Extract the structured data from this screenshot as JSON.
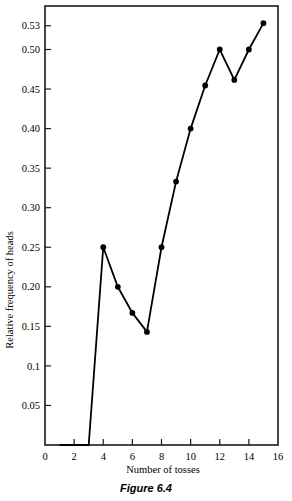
{
  "figure": {
    "caption": "Figure 6.4"
  },
  "chart_data": {
    "type": "line",
    "title": "",
    "subtitle": "",
    "xlabel": "Number of tosses",
    "ylabel": "Relative frequency of heads",
    "xlim": [
      0,
      16
    ],
    "ylim": [
      0,
      0.555
    ],
    "grid": false,
    "legend": null,
    "marker": "filled-circle",
    "line_color": "#000000",
    "marker_color": "#000000",
    "background_color": "#ffffff",
    "frame": true,
    "x_ticks": [
      0,
      2,
      4,
      6,
      8,
      10,
      12,
      14,
      16
    ],
    "x_tick_labels": [
      "0",
      "2",
      "4",
      "6",
      "8",
      "10",
      "12",
      "14",
      "16"
    ],
    "y_ticks": [
      0.05,
      0.1,
      0.15,
      0.2,
      0.25,
      0.3,
      0.35,
      0.4,
      0.45,
      0.5,
      0.53
    ],
    "y_tick_labels": [
      "0.05",
      "0.1",
      "0.15",
      "0.20",
      "0.25",
      "0.30",
      "0.35",
      "0.40",
      "0.45",
      "0.50",
      "0.53"
    ],
    "x": [
      1,
      2,
      3,
      4,
      5,
      6,
      7,
      8,
      9,
      10,
      11,
      12,
      13,
      14,
      15
    ],
    "values": [
      0,
      0,
      0,
      0.25,
      0.2,
      0.167,
      0.143,
      0.25,
      0.333,
      0.4,
      0.4545,
      0.5,
      0.4615,
      0.5,
      0.5333
    ],
    "marker_x": [
      4,
      5,
      6,
      7,
      8,
      9,
      10,
      11,
      12,
      13,
      14,
      15
    ],
    "marker_values": [
      0.25,
      0.2,
      0.167,
      0.143,
      0.25,
      0.333,
      0.4,
      0.4545,
      0.5,
      0.4615,
      0.5,
      0.5333
    ]
  }
}
